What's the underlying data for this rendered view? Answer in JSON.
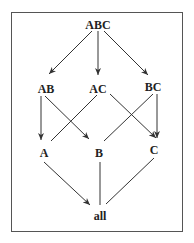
{
  "diagram": {
    "type": "lattice",
    "nodes": [
      {
        "id": "ABC",
        "label": "ABC",
        "x": 98,
        "y": 25
      },
      {
        "id": "AB",
        "label": "AB",
        "x": 47,
        "y": 89
      },
      {
        "id": "AC",
        "label": "AC",
        "x": 98,
        "y": 89
      },
      {
        "id": "BC",
        "label": "BC",
        "x": 153,
        "y": 87
      },
      {
        "id": "A",
        "label": "A",
        "x": 44,
        "y": 153
      },
      {
        "id": "B",
        "label": "B",
        "x": 99,
        "y": 153
      },
      {
        "id": "C",
        "label": "C",
        "x": 154,
        "y": 150
      },
      {
        "id": "all",
        "label": "all",
        "x": 100,
        "y": 216
      }
    ],
    "edges": [
      {
        "from": "ABC",
        "to": "AB",
        "arrow": true
      },
      {
        "from": "ABC",
        "to": "AC",
        "arrow": true
      },
      {
        "from": "ABC",
        "to": "BC",
        "arrow": true
      },
      {
        "from": "AB",
        "to": "A",
        "arrow": true
      },
      {
        "from": "AB",
        "to": "B",
        "arrow": true
      },
      {
        "from": "AC",
        "to": "A",
        "arrow": false
      },
      {
        "from": "AC",
        "to": "C",
        "arrow": true
      },
      {
        "from": "BC",
        "to": "B",
        "arrow": false
      },
      {
        "from": "BC",
        "to": "C",
        "arrow": true
      },
      {
        "from": "A",
        "to": "all",
        "arrow": true
      },
      {
        "from": "B",
        "to": "all",
        "arrow": false
      },
      {
        "from": "C",
        "to": "all",
        "arrow": false
      }
    ]
  },
  "labels": {
    "ABC": "ABC",
    "AB": "AB",
    "AC": "AC",
    "BC": "BC",
    "A": "A",
    "B": "B",
    "C": "C",
    "all": "all"
  }
}
